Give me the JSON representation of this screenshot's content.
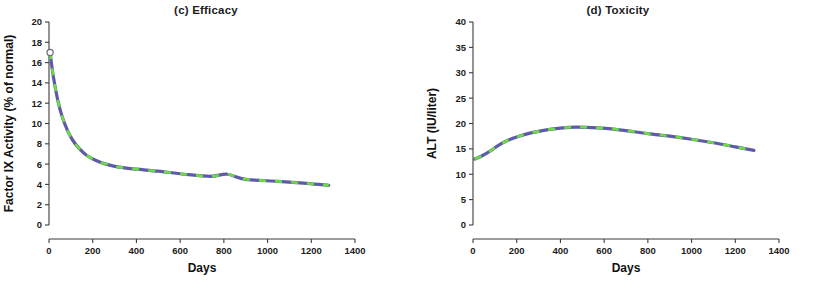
{
  "figure": {
    "shared_xlabel": "Days",
    "marker_color": "#cc63c4",
    "curve_color": "#5d5aa6",
    "curve_dash_color": "#6ddc42"
  },
  "chart_data": [
    {
      "type": "scatter",
      "panel_id": "c",
      "title": "(c) Efficacy",
      "xlabel": "Days",
      "ylabel": "Factor IX Activity (% of normal)",
      "xlim": [
        0,
        1400
      ],
      "ylim": [
        0,
        20
      ],
      "xticks": [
        0,
        200,
        400,
        600,
        800,
        1000,
        1200,
        1400
      ],
      "yticks": [
        0,
        2,
        4,
        6,
        8,
        10,
        12,
        14,
        16,
        18,
        20
      ],
      "grid": false,
      "legend": "none",
      "points": [
        {
          "x": 5,
          "y": 17.0
        },
        {
          "x": 8,
          "y": 9.0
        },
        {
          "x": 14,
          "y": 8.9
        },
        {
          "x": 20,
          "y": 9.0
        },
        {
          "x": 28,
          "y": 8.2
        },
        {
          "x": 34,
          "y": 8.0
        },
        {
          "x": 40,
          "y": 9.9
        },
        {
          "x": 45,
          "y": 8.3
        },
        {
          "x": 50,
          "y": 8.4
        },
        {
          "x": 55,
          "y": 8.0
        },
        {
          "x": 60,
          "y": 8.4
        },
        {
          "x": 64,
          "y": 8.2
        },
        {
          "x": 70,
          "y": 8.5
        },
        {
          "x": 78,
          "y": 11.3
        },
        {
          "x": 86,
          "y": 8.3
        },
        {
          "x": 95,
          "y": 8.0
        },
        {
          "x": 112,
          "y": 11.0
        },
        {
          "x": 120,
          "y": 10.9
        },
        {
          "x": 128,
          "y": 9.4
        },
        {
          "x": 185,
          "y": 5.0
        },
        {
          "x": 215,
          "y": 7.0
        },
        {
          "x": 232,
          "y": 6.1
        },
        {
          "x": 258,
          "y": 4.0
        },
        {
          "x": 292,
          "y": 3.0
        },
        {
          "x": 318,
          "y": 5.9
        },
        {
          "x": 352,
          "y": 4.5
        },
        {
          "x": 368,
          "y": 4.0
        },
        {
          "x": 455,
          "y": 4.0
        },
        {
          "x": 660,
          "y": 4.0
        },
        {
          "x": 815,
          "y": 4.9
        },
        {
          "x": 1002,
          "y": 6.0
        },
        {
          "x": 1272,
          "y": 4.9
        }
      ],
      "fit_curve": {
        "style": "blue solid with green dashes",
        "start_marker": "open-circle",
        "points": [
          {
            "x": 5,
            "y": 17.0
          },
          {
            "x": 20,
            "y": 14.6
          },
          {
            "x": 40,
            "y": 12.3
          },
          {
            "x": 60,
            "y": 10.7
          },
          {
            "x": 85,
            "y": 9.3
          },
          {
            "x": 110,
            "y": 8.3
          },
          {
            "x": 140,
            "y": 7.5
          },
          {
            "x": 170,
            "y": 6.9
          },
          {
            "x": 210,
            "y": 6.4
          },
          {
            "x": 260,
            "y": 6.0
          },
          {
            "x": 320,
            "y": 5.7
          },
          {
            "x": 400,
            "y": 5.5
          },
          {
            "x": 500,
            "y": 5.3
          },
          {
            "x": 620,
            "y": 5.0
          },
          {
            "x": 740,
            "y": 4.8
          },
          {
            "x": 815,
            "y": 5.0
          },
          {
            "x": 900,
            "y": 4.5
          },
          {
            "x": 1050,
            "y": 4.3
          },
          {
            "x": 1180,
            "y": 4.1
          },
          {
            "x": 1280,
            "y": 3.9
          }
        ]
      }
    },
    {
      "type": "scatter",
      "panel_id": "d",
      "title": "(d) Toxicity",
      "xlabel": "Days",
      "ylabel": "ALT (IU/liter)",
      "xlim": [
        0,
        1400
      ],
      "ylim": [
        0,
        40
      ],
      "xticks": [
        0,
        200,
        400,
        600,
        800,
        1000,
        1200,
        1400
      ],
      "yticks": [
        0,
        5,
        10,
        15,
        20,
        25,
        30,
        35,
        40
      ],
      "grid": false,
      "legend": "none",
      "points": [
        {
          "x": 8,
          "y": 10.0
        },
        {
          "x": 55,
          "y": 13.3
        },
        {
          "x": 62,
          "y": 13.2
        },
        {
          "x": 68,
          "y": 30.0
        },
        {
          "x": 70,
          "y": 23.0
        },
        {
          "x": 74,
          "y": 26.0
        },
        {
          "x": 78,
          "y": 26.5
        },
        {
          "x": 82,
          "y": 27.0
        },
        {
          "x": 86,
          "y": 19.0
        },
        {
          "x": 90,
          "y": 18.5
        },
        {
          "x": 94,
          "y": 18.0
        },
        {
          "x": 100,
          "y": 14.5
        },
        {
          "x": 110,
          "y": 14.0
        },
        {
          "x": 126,
          "y": 15.3
        },
        {
          "x": 132,
          "y": 15.0
        },
        {
          "x": 140,
          "y": 14.8
        },
        {
          "x": 180,
          "y": 11.0
        },
        {
          "x": 220,
          "y": 23.0
        },
        {
          "x": 298,
          "y": 13.0
        },
        {
          "x": 312,
          "y": 13.0
        },
        {
          "x": 362,
          "y": 14.0
        },
        {
          "x": 458,
          "y": 16.9
        },
        {
          "x": 662,
          "y": 24.9
        },
        {
          "x": 812,
          "y": 15.9
        },
        {
          "x": 1005,
          "y": 13.8
        },
        {
          "x": 1278,
          "y": 16.8
        }
      ],
      "fit_curve": {
        "style": "blue solid with green dashes",
        "points": [
          {
            "x": 8,
            "y": 13.0
          },
          {
            "x": 40,
            "y": 13.6
          },
          {
            "x": 80,
            "y": 14.6
          },
          {
            "x": 120,
            "y": 15.8
          },
          {
            "x": 160,
            "y": 16.7
          },
          {
            "x": 210,
            "y": 17.5
          },
          {
            "x": 270,
            "y": 18.2
          },
          {
            "x": 330,
            "y": 18.7
          },
          {
            "x": 400,
            "y": 19.1
          },
          {
            "x": 470,
            "y": 19.3
          },
          {
            "x": 540,
            "y": 19.2
          },
          {
            "x": 620,
            "y": 19.0
          },
          {
            "x": 700,
            "y": 18.6
          },
          {
            "x": 800,
            "y": 18.0
          },
          {
            "x": 900,
            "y": 17.5
          },
          {
            "x": 1000,
            "y": 16.9
          },
          {
            "x": 1100,
            "y": 16.2
          },
          {
            "x": 1200,
            "y": 15.4
          },
          {
            "x": 1285,
            "y": 14.7
          }
        ]
      }
    }
  ]
}
